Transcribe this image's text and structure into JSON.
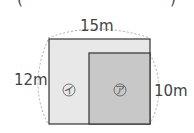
{
  "header": {
    "open_paren": "(",
    "close_paren": ")"
  },
  "labels": {
    "width": "15m",
    "height": "12m",
    "inner_height": "10m"
  },
  "regions": {
    "a": {
      "mark": "ア",
      "color": "#c8c8c8"
    },
    "b": {
      "mark": "イ",
      "color": "#e8e8e8"
    }
  },
  "colors": {
    "outline": "#333333",
    "dashed": "#aaaaaa"
  }
}
